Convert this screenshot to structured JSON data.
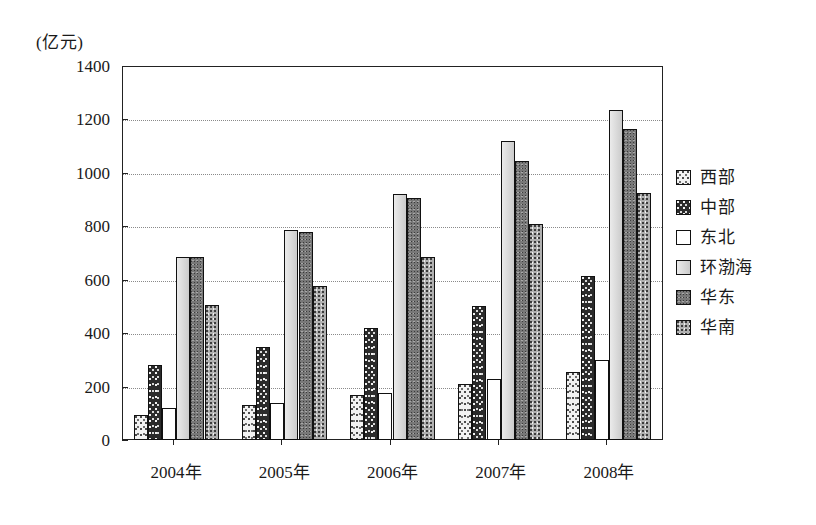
{
  "chart_data": {
    "type": "bar",
    "title": "",
    "subtitle": "",
    "xlabel": "",
    "ylabel": "(亿元)",
    "unit_label": "(亿元)",
    "ylim": [
      0,
      1400
    ],
    "ytick_step": 200,
    "ytick_labels": [
      "1400",
      "1200",
      "1000",
      "800",
      "600",
      "400",
      "200",
      "0"
    ],
    "ytick_values": [
      1400,
      1200,
      1000,
      800,
      600,
      400,
      200,
      0
    ],
    "grid": true,
    "legend_position": "right",
    "categories": [
      "2004年",
      "2005年",
      "2006年",
      "2007年",
      "2008年"
    ],
    "series": [
      {
        "name": "西部",
        "values": [
          95,
          130,
          170,
          208,
          255
        ],
        "pattern": "pat-xibu",
        "swatch_color": "#f2f2f2"
      },
      {
        "name": "中部",
        "values": [
          280,
          348,
          420,
          500,
          613
        ],
        "pattern": "pat-zhongbu",
        "swatch_color": "#2b2b2b"
      },
      {
        "name": "东北",
        "values": [
          120,
          140,
          175,
          228,
          300
        ],
        "pattern": "pat-dongbei",
        "swatch_color": "#ffffff"
      },
      {
        "name": "环渤海",
        "values": [
          685,
          785,
          920,
          1120,
          1235
        ],
        "pattern": "pat-huanbohai",
        "swatch_color": "#d2d2d2"
      },
      {
        "name": "华东",
        "values": [
          685,
          780,
          905,
          1045,
          1165
        ],
        "pattern": "pat-huadong",
        "swatch_color": "#787878"
      },
      {
        "name": "华南",
        "values": [
          505,
          575,
          685,
          810,
          925
        ],
        "pattern": "pat-huanan",
        "swatch_color": "#b0b0b0"
      }
    ]
  },
  "legend": {
    "items": [
      {
        "label": "西部"
      },
      {
        "label": "中部"
      },
      {
        "label": "东北"
      },
      {
        "label": "环渤海"
      },
      {
        "label": "华东"
      },
      {
        "label": "华南"
      }
    ]
  }
}
